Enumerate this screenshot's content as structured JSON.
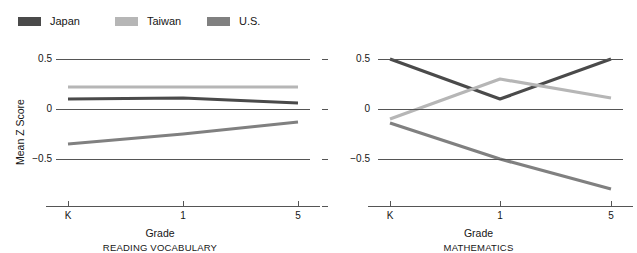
{
  "legend": {
    "items": [
      {
        "label": "Japan",
        "color": "#4a4a4a",
        "x": 18
      },
      {
        "label": "Taiwan",
        "color": "#b6b6b6",
        "x": 115
      },
      {
        "label": "U.S.",
        "color": "#808080",
        "x": 207
      }
    ]
  },
  "axes": {
    "y_label": "Mean Z Score",
    "y_ticks": [
      "0.5",
      "0",
      "−0.5"
    ],
    "y_values": [
      0.5,
      0,
      -0.5
    ],
    "x_label": "Grade",
    "x_ticks": [
      "K",
      "1",
      "5"
    ]
  },
  "chart_data": [
    {
      "type": "line",
      "title": "READING VOCABULARY",
      "xlabel": "Grade",
      "ylabel": "Mean Z Score",
      "categories": [
        "K",
        "1",
        "5"
      ],
      "ylim": [
        -0.75,
        0.75
      ],
      "yticks": [
        0.5,
        0,
        -0.5
      ],
      "grid": true,
      "legend_position": "top",
      "series": [
        {
          "name": "Japan",
          "color": "#4a4a4a",
          "values": [
            0.1,
            0.11,
            0.06
          ]
        },
        {
          "name": "Taiwan",
          "color": "#b6b6b6",
          "values": [
            0.22,
            0.22,
            0.22
          ]
        },
        {
          "name": "U.S.",
          "color": "#808080",
          "values": [
            -0.35,
            -0.25,
            -0.13
          ]
        }
      ]
    },
    {
      "type": "line",
      "title": "MATHEMATICS",
      "xlabel": "Grade",
      "ylabel": "Mean Z Score",
      "categories": [
        "K",
        "1",
        "5"
      ],
      "ylim": [
        -0.75,
        0.75
      ],
      "yticks": [
        0.5,
        0,
        -0.5
      ],
      "grid": true,
      "legend_position": "top",
      "series": [
        {
          "name": "Japan",
          "color": "#4a4a4a",
          "values": [
            0.5,
            0.1,
            0.5
          ]
        },
        {
          "name": "Taiwan",
          "color": "#b6b6b6",
          "values": [
            -0.1,
            0.3,
            0.11
          ]
        },
        {
          "name": "U.S.",
          "color": "#808080",
          "values": [
            -0.14,
            -0.5,
            -0.8
          ]
        }
      ]
    }
  ]
}
